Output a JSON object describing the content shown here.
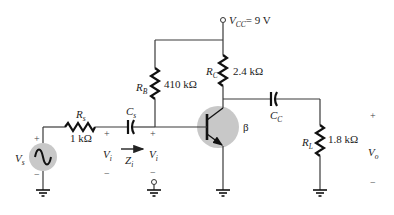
{
  "colors": {
    "wire": "#3a3a3a",
    "component_fill": "#c8c8c8",
    "text": "#222222"
  },
  "supply": {
    "symbol": "V",
    "subscript": "CC",
    "value": "= 9 V"
  },
  "components": {
    "RB": {
      "symbol": "R",
      "subscript": "B",
      "value": "410 kΩ"
    },
    "RC": {
      "symbol": "R",
      "subscript": "C",
      "value": "2.4 kΩ"
    },
    "RS": {
      "symbol": "R",
      "subscript": "s",
      "value": "1 kΩ"
    },
    "RL": {
      "symbol": "R",
      "subscript": "L",
      "value": "1.8 kΩ"
    },
    "CS": {
      "symbol": "C",
      "subscript": "s"
    },
    "CC": {
      "symbol": "C",
      "subscript": "C"
    },
    "transistor": {
      "gain_symbol": "β"
    },
    "source": {
      "symbol": "V",
      "subscript": "s",
      "plus": "+",
      "minus": "−"
    }
  },
  "port_labels": {
    "vi_left": {
      "symbol": "V",
      "subscript": "i",
      "plus": "+",
      "minus": "−"
    },
    "vi_right": {
      "symbol": "V",
      "subscript": "i",
      "plus": "+",
      "minus": "−"
    },
    "zi": {
      "symbol": "Z",
      "subscript": "i"
    },
    "vo": {
      "symbol": "V",
      "subscript": "o",
      "plus": "+",
      "minus": "−"
    }
  }
}
